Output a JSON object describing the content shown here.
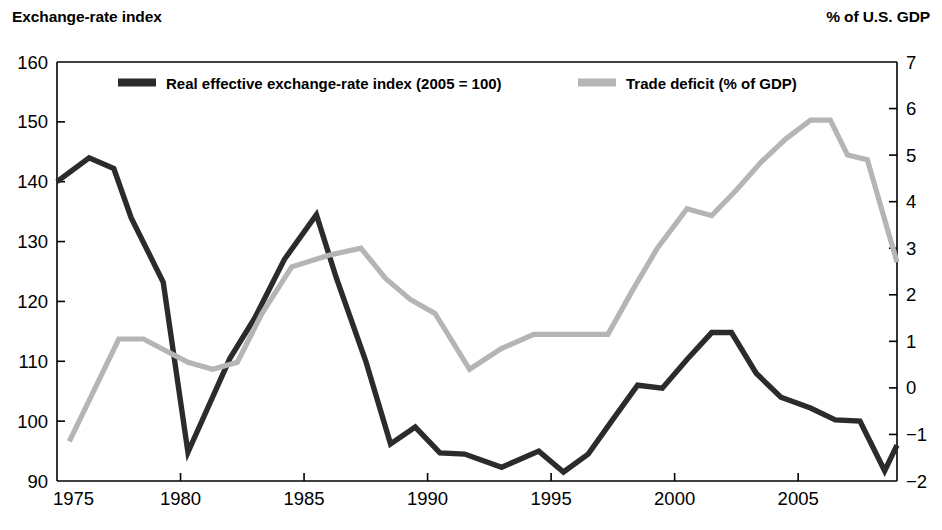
{
  "header": {
    "left_title": "Exchange-rate index",
    "right_title": "% of U.S. GDP"
  },
  "legend": [
    {
      "label": "Real effective exchange-rate index (2005 = 100)",
      "color": "#2b2b2b"
    },
    {
      "label": "Trade deficit (% of GDP)",
      "color": "#b5b5b5"
    }
  ],
  "chart_data": {
    "type": "line",
    "title": "",
    "subtitle": "",
    "xlabel": "",
    "ylabel": "Exchange-rate index",
    "y2label": "% of U.S. GDP",
    "xlim": [
      1975,
      2009
    ],
    "ylim": [
      90,
      160
    ],
    "y2lim": [
      -2,
      7
    ],
    "grid": false,
    "legend_position": "top-inside",
    "xticks": [
      1975,
      1980,
      1985,
      1990,
      1995,
      2000,
      2005
    ],
    "xticklabels": [
      "1975",
      "1980",
      "1985",
      "1990",
      "1995",
      "2000",
      "2005"
    ],
    "yticks": [
      90,
      100,
      110,
      120,
      130,
      140,
      150,
      160
    ],
    "yticklabels": [
      "90",
      "100",
      "110",
      "120",
      "130",
      "140",
      "150",
      "160"
    ],
    "y2ticks": [
      -2,
      -1,
      0,
      1,
      2,
      3,
      4,
      5,
      6,
      7
    ],
    "y2ticklabels": [
      "−2",
      "−1",
      "0",
      "1",
      "2",
      "3",
      "4",
      "5",
      "6",
      "7"
    ],
    "series": [
      {
        "name": "Real effective exchange-rate index (2005 = 100)",
        "color": "#2b2b2b",
        "axis": "left",
        "x": [
          1975.0,
          1976.3,
          1977.3,
          1978.0,
          1979.3,
          1980.3,
          1982.0,
          1983.0,
          1984.2,
          1985.5,
          1986.3,
          1987.5,
          1988.5,
          1989.5,
          1990.5,
          1991.5,
          1993.0,
          1994.5,
          1995.5,
          1996.5,
          1997.5,
          1998.5,
          1999.5,
          2000.5,
          2001.5,
          2002.3,
          2003.3,
          2004.3,
          2005.5,
          2006.5,
          2007.5,
          2008.5,
          2009.0
        ],
        "y": [
          140.0,
          144.0,
          142.2,
          134.0,
          123.2,
          94.8,
          110.5,
          117.2,
          127.0,
          134.5,
          124.0,
          110.0,
          96.2,
          99.0,
          94.7,
          94.5,
          92.3,
          95.0,
          91.5,
          94.5,
          100.3,
          106.0,
          105.5,
          110.3,
          114.8,
          114.8,
          108.0,
          104.0,
          102.2,
          100.2,
          100.0,
          91.7,
          96.0
        ]
      },
      {
        "name": "Trade deficit (% of GDP)",
        "color": "#b5b5b5",
        "axis": "right",
        "x": [
          1975.5,
          1977.5,
          1978.5,
          1980.3,
          1981.3,
          1982.3,
          1983.3,
          1984.5,
          1986.0,
          1987.3,
          1988.3,
          1989.3,
          1990.3,
          1991.7,
          1993.0,
          1994.3,
          1995.5,
          1997.3,
          1998.3,
          1999.3,
          2000.5,
          2001.5,
          2002.5,
          2003.5,
          2004.5,
          2005.5,
          2006.3,
          2007.0,
          2007.8,
          2009.0
        ],
        "y": [
          -1.15,
          1.05,
          1.05,
          0.55,
          0.4,
          0.55,
          1.6,
          2.6,
          2.85,
          3.0,
          2.35,
          1.9,
          1.6,
          0.4,
          0.85,
          1.15,
          1.15,
          1.15,
          2.1,
          3.0,
          3.85,
          3.7,
          4.25,
          4.85,
          5.35,
          5.75,
          5.75,
          5.0,
          4.9,
          2.7
        ]
      }
    ],
    "annotations": []
  }
}
